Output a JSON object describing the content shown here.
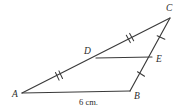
{
  "figure": {
    "type": "geometry-diagram",
    "background_color": "#ffffff",
    "stroke_color": "#3a3a3a",
    "text_color": "#2b2b2b",
    "points": {
      "A": {
        "label": "A",
        "x": 22,
        "y": 93,
        "label_x": 12,
        "label_y": 97
      },
      "B": {
        "label": "B",
        "x": 130,
        "y": 91,
        "label_x": 134,
        "label_y": 99
      },
      "C": {
        "label": "C",
        "x": 170,
        "y": 18,
        "label_x": 166,
        "label_y": 11
      },
      "D": {
        "label": "D",
        "x": 96,
        "y": 58,
        "label_x": 84,
        "label_y": 54
      },
      "E": {
        "label": "E",
        "x": 152,
        "y": 57,
        "label_x": 156,
        "label_y": 62
      }
    },
    "segments": [
      {
        "name": "A-to-C",
        "from": "A",
        "to": "C"
      },
      {
        "name": "A-to-B",
        "from": "A",
        "to": "B"
      },
      {
        "name": "B-to-C",
        "from": "B",
        "to": "C"
      },
      {
        "name": "D-to-E",
        "from": "D",
        "to": "E"
      }
    ],
    "tick_marks": [
      {
        "name": "tick-AD",
        "segment": "AD",
        "count": 2,
        "x": 59,
        "y": 75.5
      },
      {
        "name": "tick-DC",
        "segment": "DC",
        "count": 2,
        "x": 130,
        "y": 38
      },
      {
        "name": "tick-CE",
        "segment": "CE",
        "count": 1,
        "x": 161,
        "y": 37.5
      },
      {
        "name": "tick-EB",
        "segment": "EB",
        "count": 1,
        "x": 141,
        "y": 74
      }
    ],
    "measurements": [
      {
        "name": "AB-length",
        "text": "6 cm.",
        "x": 79,
        "y": 105
      }
    ]
  }
}
